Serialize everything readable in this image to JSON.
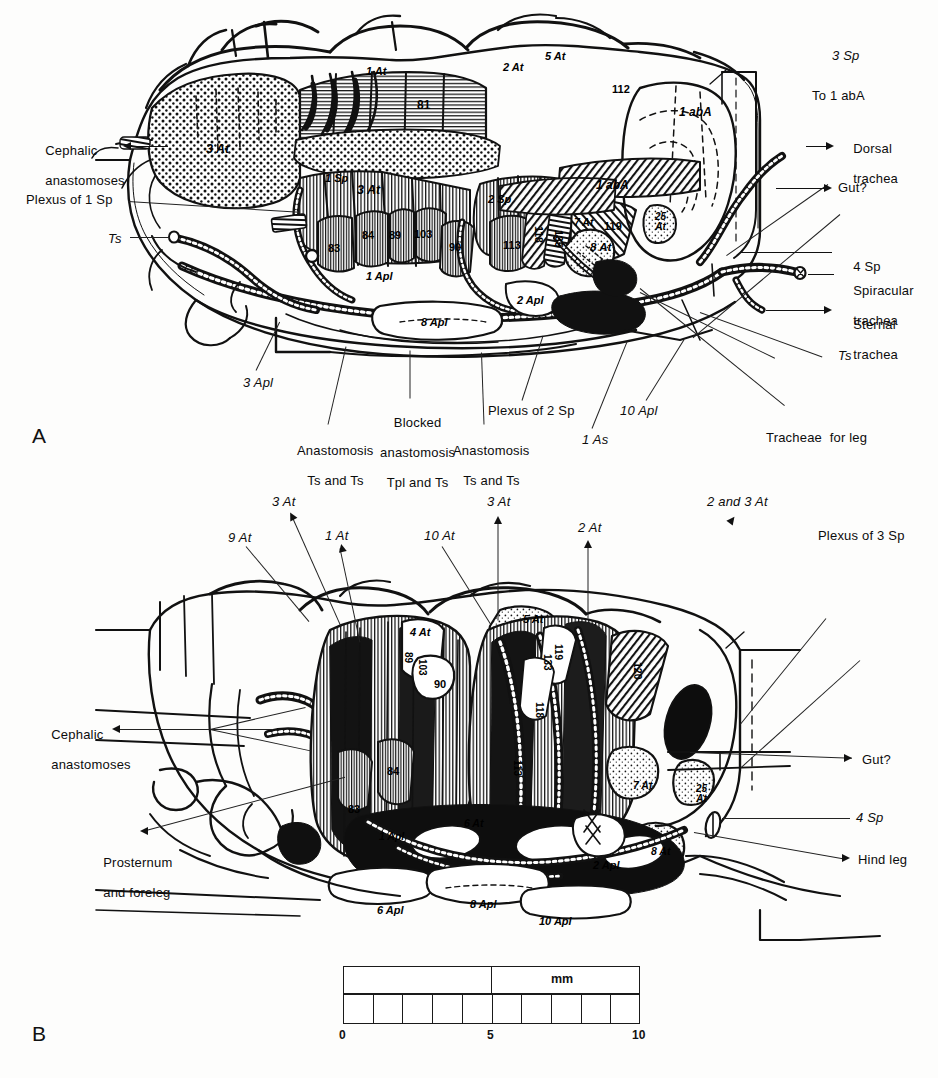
{
  "figure": {
    "background_color": "#fdfdfc",
    "ink_color": "#0c0c0c"
  },
  "panels": [
    {
      "letter": "A",
      "name": "panel-a"
    },
    {
      "letter": "B",
      "name": "panel-b"
    }
  ],
  "panel_a": {
    "callouts_left": [
      {
        "id": "cephalic-anastomoses",
        "line1": "Cephalic",
        "line2": "anastomoses",
        "italic": false
      },
      {
        "id": "plexus-of-1-sp",
        "text": "Plexus of 1 Sp",
        "italic_part": "Sp"
      },
      {
        "id": "ts-left",
        "text": "Ts",
        "italic": true
      }
    ],
    "callouts_right": [
      {
        "id": "3-sp",
        "text": "3 Sp"
      },
      {
        "id": "to-1-aba",
        "text": "To 1 abA"
      },
      {
        "id": "dorsal-trachea",
        "line1": "Dorsal",
        "line2": "trachea"
      },
      {
        "id": "gut",
        "text": "Gut?"
      },
      {
        "id": "4-sp",
        "text": "4 Sp"
      },
      {
        "id": "spiracular-trachea",
        "line1": "Spiracular",
        "line2": "trachea"
      },
      {
        "id": "sternal-trachea",
        "line1": "Sternal",
        "line2": "trachea"
      },
      {
        "id": "ts-right",
        "text": "Ts"
      }
    ],
    "callouts_bottom": [
      {
        "id": "3-apl",
        "text": "3 Apl"
      },
      {
        "id": "anastomosis-ts-ts-left",
        "line1": "Anastomosis",
        "line2": "Ts and Ts"
      },
      {
        "id": "blocked-anastomosis",
        "line1": "Blocked",
        "line2": "anastomosis",
        "line3": "Tpl and Ts"
      },
      {
        "id": "anastomosis-ts-ts-right",
        "line1": "Anastomosis",
        "line2": "Ts and Ts"
      },
      {
        "id": "plexus-of-2-sp",
        "text": "Plexus of 2 Sp"
      },
      {
        "id": "1-as",
        "text": "1 As"
      },
      {
        "id": "10-apl",
        "text": "10 Apl"
      },
      {
        "id": "tracheae-for-leg",
        "text": "Tracheae  for leg"
      }
    ],
    "interior_labels": [
      {
        "id": "a-3at-left",
        "text": "3 At",
        "x": 206,
        "y": 143
      },
      {
        "id": "a-1at",
        "text": "1 At",
        "x": 366,
        "y": 66
      },
      {
        "id": "a-2at",
        "text": "2 At",
        "x": 503,
        "y": 62
      },
      {
        "id": "a-5at",
        "text": "5 At",
        "x": 545,
        "y": 53
      },
      {
        "id": "a-112",
        "text": "112",
        "x": 612,
        "y": 84
      },
      {
        "id": "a-81",
        "text": "81",
        "x": 417,
        "y": 99
      },
      {
        "id": "a-1aba-top",
        "text": "1 abA",
        "x": 683,
        "y": 107
      },
      {
        "id": "a-1sp",
        "text": "1 Sp",
        "x": 327,
        "y": 174
      },
      {
        "id": "a-3at-mid",
        "text": "3 At",
        "x": 359,
        "y": 185
      },
      {
        "id": "a-2sp",
        "text": "2 Sp",
        "x": 490,
        "y": 195
      },
      {
        "id": "a-1aba-mid",
        "text": "1 abA",
        "x": 600,
        "y": 180
      },
      {
        "id": "a-83",
        "text": "83",
        "x": 330,
        "y": 244
      },
      {
        "id": "a-84",
        "text": "84",
        "x": 364,
        "y": 231
      },
      {
        "id": "a-89",
        "text": "89",
        "x": 391,
        "y": 231
      },
      {
        "id": "a-103",
        "text": "103",
        "x": 417,
        "y": 230
      },
      {
        "id": "a-90",
        "text": "90",
        "x": 451,
        "y": 243
      },
      {
        "id": "a-113",
        "text": "113",
        "x": 505,
        "y": 241
      },
      {
        "id": "a-118",
        "text": "118",
        "x": 535,
        "y": 228
      },
      {
        "id": "a-135",
        "text": "135",
        "x": 555,
        "y": 232
      },
      {
        "id": "a-7at",
        "text": "7 At",
        "x": 578,
        "y": 219
      },
      {
        "id": "a-119",
        "text": "119",
        "x": 606,
        "y": 222
      },
      {
        "id": "a-25at",
        "text": "25\nAt",
        "x": 659,
        "y": 214
      },
      {
        "id": "a-8at",
        "text": "8 At",
        "x": 594,
        "y": 242
      },
      {
        "id": "a-1apl",
        "text": "1 Apl",
        "x": 370,
        "y": 272
      },
      {
        "id": "a-2apl",
        "text": "2 Apl",
        "x": 521,
        "y": 296
      },
      {
        "id": "a-8apl",
        "text": "8 Apl",
        "x": 425,
        "y": 318
      }
    ]
  },
  "panel_b": {
    "callouts_top": [
      {
        "id": "b-9at",
        "text": "9 At"
      },
      {
        "id": "b-3at-left",
        "text": "3 At"
      },
      {
        "id": "b-1at",
        "text": "1 At"
      },
      {
        "id": "b-10at",
        "text": "10 At"
      },
      {
        "id": "b-3at-mid",
        "text": "3 At"
      },
      {
        "id": "b-2at",
        "text": "2 At"
      },
      {
        "id": "b-2and3at",
        "text": "2 and 3 At"
      },
      {
        "id": "b-plexus-of-3-sp",
        "text": "Plexus of 3 Sp"
      }
    ],
    "callouts_left": [
      {
        "id": "b-cephalic-anastomoses",
        "line1": "Cephalic",
        "line2": "anastomoses"
      },
      {
        "id": "b-prosternum-foreleg",
        "line1": "Prosternum",
        "line2": "and foreleg"
      }
    ],
    "callouts_right": [
      {
        "id": "b-gut",
        "text": "Gut?"
      },
      {
        "id": "b-4sp",
        "text": "4 Sp"
      },
      {
        "id": "b-hind-leg",
        "text": "Hind leg"
      }
    ],
    "interior_labels": [
      {
        "id": "b-5at",
        "text": "5 At",
        "x": 523,
        "y": 616
      },
      {
        "id": "b-4at",
        "text": "4 At",
        "x": 413,
        "y": 628
      },
      {
        "id": "b-89",
        "text": "89",
        "x": 404,
        "y": 655
      },
      {
        "id": "b-103",
        "text": "103",
        "x": 418,
        "y": 663
      },
      {
        "id": "b-90",
        "text": "90",
        "x": 437,
        "y": 681
      },
      {
        "id": "b-119",
        "text": "119",
        "x": 554,
        "y": 648
      },
      {
        "id": "b-133",
        "text": "133",
        "x": 545,
        "y": 656
      },
      {
        "id": "b-118",
        "text": "118",
        "x": 535,
        "y": 705
      },
      {
        "id": "b-120",
        "text": "120",
        "x": 634,
        "y": 664
      },
      {
        "id": "b-84",
        "text": "84",
        "x": 389,
        "y": 768
      },
      {
        "id": "b-83",
        "text": "83",
        "x": 350,
        "y": 805
      },
      {
        "id": "b-113",
        "text": "113",
        "x": 513,
        "y": 762
      },
      {
        "id": "b-7at",
        "text": "7 At",
        "x": 637,
        "y": 782
      },
      {
        "id": "b-25at",
        "text": "25\nAt",
        "x": 700,
        "y": 786
      },
      {
        "id": "b-1apl",
        "text": "1 Apl",
        "x": 383,
        "y": 833
      },
      {
        "id": "b-6at",
        "text": "6 At",
        "x": 468,
        "y": 820
      },
      {
        "id": "b-8at",
        "text": "8 At",
        "x": 655,
        "y": 848
      },
      {
        "id": "b-2apl",
        "text": "2 Apl",
        "x": 597,
        "y": 862
      },
      {
        "id": "b-6apl",
        "text": "6 Apl",
        "x": 381,
        "y": 907
      },
      {
        "id": "b-8apl",
        "text": "8 Apl",
        "x": 474,
        "y": 901
      },
      {
        "id": "b-10apl",
        "text": "10 Apl",
        "x": 543,
        "y": 918
      }
    ]
  },
  "scale_bar": {
    "unit": "mm",
    "ticks": [
      {
        "label": "0",
        "value": 0
      },
      {
        "label": "5",
        "value": 5
      },
      {
        "label": "10",
        "value": 10
      }
    ],
    "minor_divisions": 10,
    "left_px": 343,
    "right_px": 640,
    "top_px": 966,
    "bottom_px": 1026
  }
}
